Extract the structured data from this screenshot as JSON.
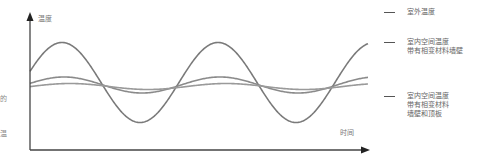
{
  "chart_data": {
    "type": "line",
    "title": "",
    "xlabel": "时间",
    "ylabel": "温度",
    "grid": false,
    "legend_position": "right",
    "axis": {
      "x_has_arrow": true,
      "y_has_arrow": true,
      "ticks": false
    },
    "series": [
      {
        "name": "室外温度",
        "color": "#7a7a7a",
        "shape": "sine",
        "center_px": 82.5,
        "amplitude_px": 40,
        "period_px": 156,
        "first_peak_x_px": 62,
        "relative_amplitude": 1.0
      },
      {
        "name": "室内空间温度 带有相变材料墙壁",
        "color": "#8a8a8a",
        "shape": "sine",
        "center_px": 85,
        "amplitude_px": 8,
        "period_px": 156,
        "first_peak_x_px": 64,
        "relative_amplitude": 0.2
      },
      {
        "name": "室内空间温度 带有相变材料墙壁和顶板",
        "color": "#9a9a9a",
        "shape": "sine",
        "center_px": 86.5,
        "amplitude_px": 3,
        "period_px": 156,
        "first_peak_x_px": 70,
        "relative_amplitude": 0.075
      }
    ],
    "x_range_px": [
      30,
      368
    ],
    "periods_shown": 2.2
  },
  "labels": {
    "y_axis": "温度",
    "x_axis": "时间",
    "edge_left_1": "的",
    "edge_left_2": "温"
  },
  "legend": {
    "items": [
      {
        "label": "室外温度"
      },
      {
        "label": "室内空间温度\n带有相变材料墙壁"
      },
      {
        "label": "室内空间温度\n带有相变材料\n墙壁和顶板"
      }
    ]
  },
  "colors": {
    "axis": "#444444",
    "curve": "#808080",
    "text": "#777777"
  }
}
